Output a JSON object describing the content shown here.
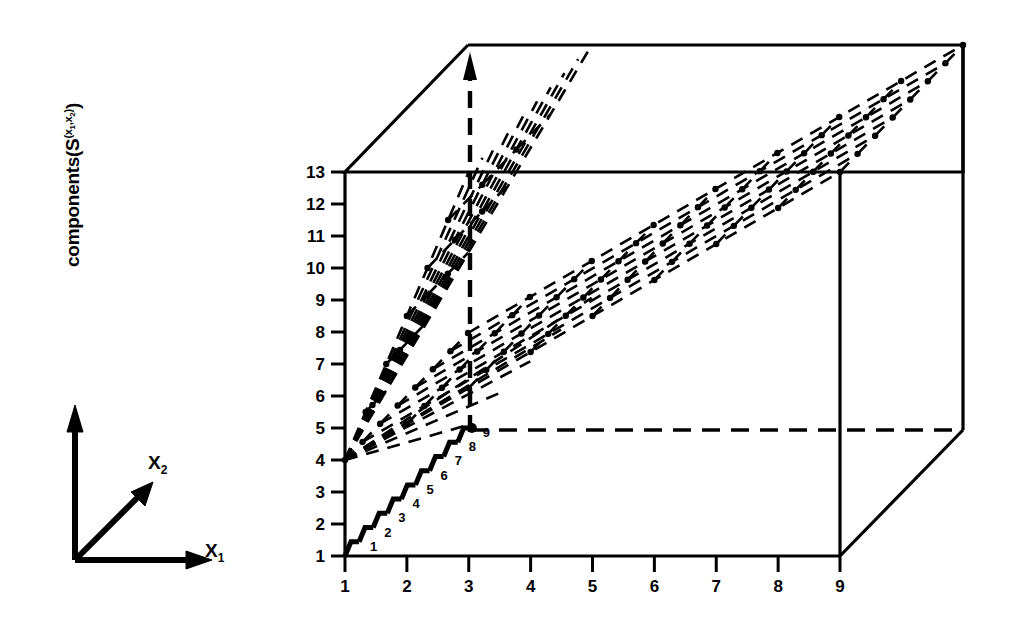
{
  "figure": {
    "type": "3d-surface-plot",
    "background": "#ffffff",
    "ink_color": "#000000"
  },
  "vector_axes": {
    "name": "coordinate-axes-key",
    "origin_label": "",
    "x1": {
      "label": "X",
      "subscript": "1"
    },
    "x2": {
      "label": "X",
      "subscript": "2"
    },
    "vertical": {
      "text_main": "components(S",
      "text_sup_open": "(x",
      "text_sup_sub1": "1",
      "text_sup_mid": ",x",
      "text_sup_sub2": "2",
      "text_sup_close": ")",
      "text_tail": ")",
      "full": "components(S (x1,x2))"
    }
  },
  "chart_data": {
    "type": "line",
    "title": "",
    "xlabel": "",
    "ylabel": "components(S (x1,x2))",
    "grid": false,
    "legend": null,
    "xticks": [
      "1",
      "2",
      "3",
      "4",
      "5",
      "6",
      "7",
      "8",
      "9"
    ],
    "xlim": [
      1,
      9
    ],
    "yticks": [
      "1",
      "2",
      "3",
      "4",
      "5",
      "6",
      "7",
      "8",
      "9",
      "10",
      "11",
      "12",
      "13"
    ],
    "ylim": [
      1,
      13
    ],
    "step_labels": [
      "1",
      "2",
      "3",
      "4",
      "5",
      "6",
      "7",
      "8",
      "9"
    ],
    "step_series": {
      "name": "staircase-front-floor",
      "x": [
        1,
        2,
        3,
        4,
        5,
        6,
        7,
        8,
        9
      ],
      "y": [
        1,
        1,
        1,
        1,
        1,
        1,
        1,
        1,
        1
      ]
    },
    "series": [
      {
        "name": "mesh-ridge-1",
        "x": [
          1,
          9
        ],
        "y": [
          4,
          13
        ]
      },
      {
        "name": "mesh-ridge-2",
        "x": [
          1,
          9
        ],
        "y": [
          4,
          13
        ]
      },
      {
        "name": "mesh-ridge-3",
        "x": [
          1,
          9
        ],
        "y": [
          4,
          13
        ]
      },
      {
        "name": "mesh-ridge-4",
        "x": [
          1,
          9
        ],
        "y": [
          4,
          13
        ]
      },
      {
        "name": "mesh-ridge-5",
        "x": [
          1,
          9
        ],
        "y": [
          4,
          13
        ]
      },
      {
        "name": "mesh-ridge-6",
        "x": [
          1,
          9
        ],
        "y": [
          4,
          13
        ]
      },
      {
        "name": "mesh-ridge-7",
        "x": [
          1,
          9
        ],
        "y": [
          4,
          13
        ]
      },
      {
        "name": "mesh-ridge-8",
        "x": [
          1,
          9
        ],
        "y": [
          4,
          13
        ]
      },
      {
        "name": "fan-peak",
        "x": [
          1,
          3
        ],
        "y": [
          4,
          13
        ]
      }
    ],
    "annotations": [
      {
        "name": "peak-arrow",
        "x": 3,
        "note": "dashed vertical with up-arrow at x=3 rising above the box top"
      },
      {
        "name": "floor-dashed-line",
        "y": 5,
        "note": "horizontal dashed line across plot floor"
      }
    ]
  }
}
